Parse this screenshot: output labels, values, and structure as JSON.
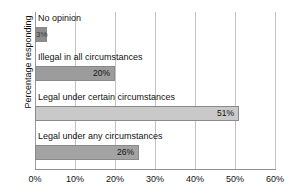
{
  "chart_data": {
    "type": "bar",
    "orientation": "horizontal",
    "title": "",
    "xlabel": "",
    "ylabel": "Percentage responding",
    "categories": [
      "No opinion",
      "Illegal in all circumstances",
      "Legal under certain circumstances",
      "Legal under any circumstances"
    ],
    "values": [
      3,
      20,
      51,
      26
    ],
    "value_labels": [
      "3%",
      "20%",
      "51%",
      "26%"
    ],
    "bar_colors": [
      "#8d8d8d",
      "#9c9c9c",
      "#c9c9c9",
      "#a3a3a3"
    ],
    "xlim": [
      0,
      60
    ],
    "xticks": [
      0,
      10,
      20,
      30,
      40,
      50,
      60
    ],
    "xtick_labels": [
      "0%",
      "10%",
      "20%",
      "30%",
      "40%",
      "50%",
      "60%"
    ],
    "grid": true,
    "grid_axis": "x",
    "legend": "none"
  },
  "axis": {
    "gridline_color": "#c4c4c4",
    "axis_color": "#8f8f8f"
  }
}
